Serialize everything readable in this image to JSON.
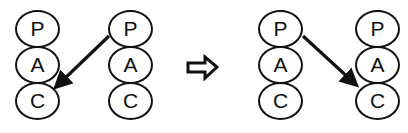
{
  "figure": {
    "type": "diagram",
    "background_color": "#ffffff",
    "stroke_color": "#111111",
    "width": 408,
    "height": 133
  },
  "nodes": {
    "labels": [
      "P",
      "A",
      "C"
    ]
  },
  "panels": [
    {
      "id": "before",
      "name": "before-panel",
      "columns": [
        {
          "id": "before-left",
          "name": "before-left-stack",
          "x": 15,
          "y": 10,
          "nodes": [
            {
              "label": "P",
              "name": "node-p"
            },
            {
              "label": "A",
              "name": "node-a"
            },
            {
              "label": "C",
              "name": "node-c"
            }
          ]
        },
        {
          "id": "before-right",
          "name": "before-right-stack",
          "x": 108,
          "y": 10,
          "nodes": [
            {
              "label": "P",
              "name": "node-p"
            },
            {
              "label": "A",
              "name": "node-a"
            },
            {
              "label": "C",
              "name": "node-c"
            }
          ]
        }
      ],
      "connector": {
        "name": "before-connector-arrow",
        "from": {
          "x": 109,
          "y": 36
        },
        "to": {
          "x": 57,
          "y": 86
        },
        "direction": "right-to-left-down",
        "source_node": "P",
        "target_node": "C"
      }
    },
    {
      "id": "after",
      "name": "after-panel",
      "columns": [
        {
          "id": "after-left",
          "name": "after-left-stack",
          "x": 258,
          "y": 10,
          "nodes": [
            {
              "label": "P",
              "name": "node-p"
            },
            {
              "label": "A",
              "name": "node-a"
            },
            {
              "label": "C",
              "name": "node-c"
            }
          ]
        },
        {
          "id": "after-right",
          "name": "after-right-stack",
          "x": 355,
          "y": 10,
          "nodes": [
            {
              "label": "P",
              "name": "node-p"
            },
            {
              "label": "A",
              "name": "node-a"
            },
            {
              "label": "C",
              "name": "node-c"
            }
          ]
        }
      ],
      "connector": {
        "name": "after-connector-arrow",
        "from": {
          "x": 303,
          "y": 36
        },
        "to": {
          "x": 356,
          "y": 85
        },
        "direction": "left-to-right-down",
        "source_node": "P",
        "target_node": "A"
      }
    }
  ],
  "transform_arrow": {
    "name": "transform-block-arrow",
    "glyph": "right-block-arrow",
    "x": 187,
    "y": 55,
    "width": 30,
    "height": 25
  }
}
